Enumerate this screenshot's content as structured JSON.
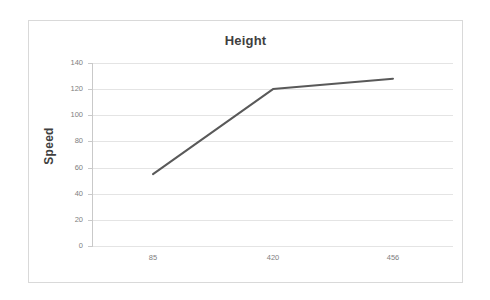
{
  "chart_data": {
    "type": "line",
    "title": "Height",
    "xlabel": "",
    "ylabel": "Speed",
    "categories": [
      "85",
      "420",
      "456"
    ],
    "x": [
      85,
      420,
      456
    ],
    "values": [
      55,
      120,
      128
    ],
    "series": [
      {
        "name": "Height",
        "values": [
          55,
          120,
          128
        ]
      }
    ],
    "ylim": [
      0,
      140
    ],
    "yticks": [
      0,
      20,
      40,
      60,
      80,
      100,
      120,
      140
    ],
    "ytick_labels": [
      "0",
      "20",
      "40",
      "60",
      "80",
      "100",
      "120",
      "140"
    ],
    "xtick_labels": [
      "85",
      "420",
      "456"
    ],
    "grid": true,
    "legend": false,
    "legend_position": "none",
    "line_color": "#595959",
    "grid_color": "#e4e4e4",
    "axis_color": "#c9c9c9",
    "text_color": "#808080",
    "title_color": "#3f3f3f",
    "border_color": "#d9d9d9",
    "background_color": "#ffffff"
  }
}
